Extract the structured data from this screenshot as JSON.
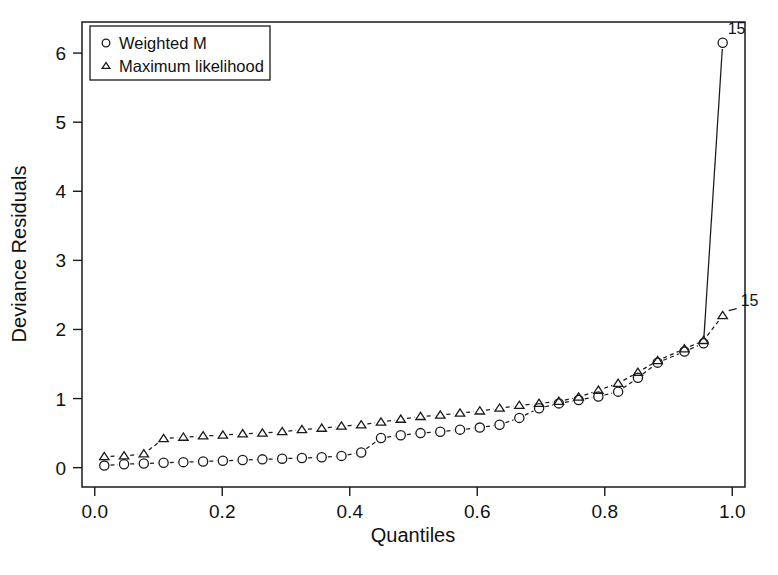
{
  "chart_data": {
    "type": "scatter",
    "title": "",
    "subtitle": "",
    "xlabel": "Quantiles",
    "ylabel": "Deviance Residuals",
    "xlim": [
      -0.02,
      1.02
    ],
    "ylim": [
      -0.28,
      6.45
    ],
    "xticks": [
      0.0,
      0.2,
      0.4,
      0.6,
      0.8,
      1.0
    ],
    "xticklabels": [
      "0.0",
      "0.2",
      "0.4",
      "0.6",
      "0.8",
      "1.0"
    ],
    "yticks": [
      0,
      1,
      2,
      3,
      4,
      5,
      6
    ],
    "yticklabels": [
      "0",
      "1",
      "2",
      "3",
      "4",
      "5",
      "6"
    ],
    "grid": false,
    "legend_position": "top-left",
    "legend": [
      {
        "label": "Weighted M",
        "marker": "circle"
      },
      {
        "label": "Maximum likelihood",
        "marker": "triangle"
      }
    ],
    "series": [
      {
        "name": "Weighted M",
        "marker": "circle",
        "linestyle": "dashed",
        "x": [
          0.015,
          0.046,
          0.077,
          0.108,
          0.139,
          0.17,
          0.201,
          0.232,
          0.263,
          0.294,
          0.325,
          0.356,
          0.387,
          0.418,
          0.449,
          0.48,
          0.511,
          0.542,
          0.573,
          0.604,
          0.635,
          0.666,
          0.697,
          0.728,
          0.759,
          0.79,
          0.821,
          0.852,
          0.883,
          0.925,
          0.955,
          0.985
        ],
        "y": [
          0.03,
          0.05,
          0.06,
          0.07,
          0.08,
          0.09,
          0.1,
          0.11,
          0.12,
          0.13,
          0.14,
          0.15,
          0.17,
          0.22,
          0.43,
          0.47,
          0.5,
          0.52,
          0.55,
          0.58,
          0.62,
          0.72,
          0.86,
          0.93,
          0.98,
          1.03,
          1.1,
          1.3,
          1.52,
          1.68,
          1.8,
          6.15
        ]
      },
      {
        "name": "Maximum likelihood",
        "marker": "triangle",
        "linestyle": "dashed",
        "x": [
          0.015,
          0.046,
          0.077,
          0.108,
          0.139,
          0.17,
          0.201,
          0.232,
          0.263,
          0.294,
          0.325,
          0.356,
          0.387,
          0.418,
          0.449,
          0.48,
          0.511,
          0.542,
          0.573,
          0.604,
          0.635,
          0.666,
          0.697,
          0.728,
          0.759,
          0.79,
          0.821,
          0.852,
          0.883,
          0.925,
          0.955,
          0.985
        ],
        "y": [
          0.16,
          0.17,
          0.2,
          0.42,
          0.44,
          0.46,
          0.47,
          0.49,
          0.5,
          0.52,
          0.55,
          0.57,
          0.6,
          0.62,
          0.66,
          0.7,
          0.74,
          0.76,
          0.79,
          0.82,
          0.86,
          0.9,
          0.93,
          0.96,
          1.02,
          1.12,
          1.22,
          1.38,
          1.55,
          1.72,
          1.84,
          2.2
        ]
      }
    ],
    "annotations": [
      {
        "label": "15",
        "x": 0.985,
        "y": 6.15,
        "series": "Weighted M"
      },
      {
        "label": "15",
        "x": 0.985,
        "y": 2.2,
        "series": "Maximum likelihood"
      }
    ]
  }
}
